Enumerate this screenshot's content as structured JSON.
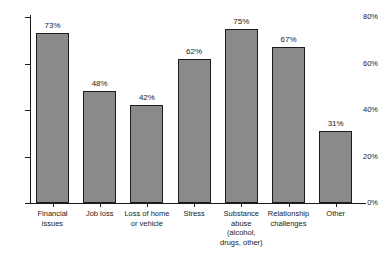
{
  "chart_data": {
    "type": "bar",
    "title": "",
    "subtitle": "",
    "xlabel": "",
    "ylabel": "",
    "ylim": [
      0,
      80
    ],
    "grid": false,
    "legend": false,
    "y_ticks": [
      "0%",
      "20%",
      "40%",
      "60%",
      "80%"
    ],
    "y_tick_values": [
      0,
      20,
      40,
      60,
      80
    ],
    "categories": [
      "Financial\nissues",
      "Job loss",
      "Loss of home\nor vehicle",
      "Stress",
      "Substance\nabuse\n(alcohol,\ndrugs, other)",
      "Relationship\nchallenges",
      "Other"
    ],
    "values": [
      73,
      48,
      42,
      62,
      75,
      67,
      31
    ],
    "value_labels": [
      "73%",
      "48%",
      "42%",
      "62%",
      "75%",
      "67%",
      "31%"
    ],
    "colors": {
      "bar_fill": "#8a8a8a",
      "bar_edge": "#1c1c1c",
      "axis": "#1a1a1a",
      "text": "#1a1a1a",
      "background": "#ffffff"
    }
  }
}
